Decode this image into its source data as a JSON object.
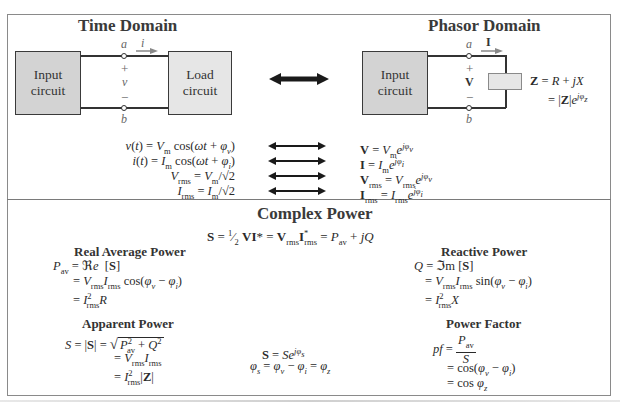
{
  "time_domain": {
    "title": "Time Domain",
    "input_box": "Input circuit",
    "load_box": "Load circuit",
    "terminal_top": "a",
    "terminal_bottom": "b",
    "current_label": "i",
    "plus": "+",
    "minus": "−",
    "voltage_label": "v"
  },
  "phasor_domain": {
    "title": "Phasor Domain",
    "input_box": "Input circuit",
    "terminal_top": "a",
    "terminal_bottom": "b",
    "current_label": "I",
    "plus": "+",
    "minus": "−",
    "voltage_label": "V",
    "impedance_line1": "Z = R + jX",
    "impedance_line2": "= |Z|e^{jφz}"
  },
  "correspondences": [
    {
      "time": "v(t) = Vm cos(ωt + φv)",
      "phasor": "V = Vm e^{jφv}"
    },
    {
      "time": "i(t) = Im cos(ωt + φi)",
      "phasor": "I = Im e^{jφi}"
    },
    {
      "time": "Vrms = Vm/√2",
      "phasor": "Vrms = Vrms e^{jφv}"
    },
    {
      "time": "Irms = Im/√2",
      "phasor": "Irms = Irms e^{jφi}"
    }
  ],
  "complex_power": {
    "title": "Complex Power",
    "main_equation": "S = ½ VI* = Vrms I*rms = Pav + jQ",
    "real_power": {
      "title": "Real Average Power",
      "lines": [
        "Pav = ℜe [S]",
        "= Vrms Irms cos(φv − φi)",
        "= I²rms R"
      ]
    },
    "reactive_power": {
      "title": "Reactive Power",
      "lines": [
        "Q = ℑm [S]",
        "= Vrms Irms sin(φv − φi)",
        "= I²rms X"
      ]
    },
    "apparent_power": {
      "title": "Apparent Power",
      "lines": [
        "S = |S| = √(P²av + Q²)",
        "= Vrms Irms",
        "= I²rms |Z|"
      ]
    },
    "polar_form": {
      "lines": [
        "S = S e^{jφs}",
        "φs = φv − φi = φz"
      ]
    },
    "power_factor": {
      "title": "Power Factor",
      "lines": [
        "pf = Pav / S",
        "= cos(φv − φi)",
        "= cos φz"
      ]
    }
  },
  "colors": {
    "frame": "#8a8a8a",
    "input_box_fill": "#d3d3d3",
    "load_box_fill": "#e6e6e6",
    "arrow": "#1a1a1a",
    "label_gray": "#666666",
    "impedance_fill": "#e6e6e6"
  }
}
